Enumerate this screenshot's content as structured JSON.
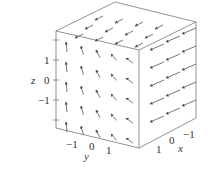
{
  "figure": {
    "type": "3d-vector-field",
    "axes": {
      "x": {
        "label": "x",
        "ticks": [
          "1",
          "0",
          "−1"
        ]
      },
      "y": {
        "label": "y",
        "ticks": [
          "−1",
          "0",
          "1"
        ]
      },
      "z": {
        "label": "z",
        "ticks": [
          "1",
          "0",
          "−1"
        ]
      }
    },
    "colors": {
      "lines": "#777777",
      "arrows": "#555555",
      "background": "#ffffff"
    }
  }
}
